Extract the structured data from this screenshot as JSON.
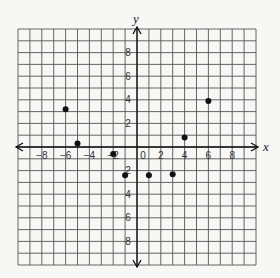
{
  "chart_data": {
    "type": "scatter",
    "title": "",
    "xlabel": "x",
    "ylabel": "y",
    "xlim": [
      -10,
      10
    ],
    "ylim": [
      -10,
      10
    ],
    "grid": true,
    "grid_step": 1,
    "x_ticks": [
      -8,
      -6,
      -4,
      -2,
      0,
      2,
      4,
      6,
      8
    ],
    "y_ticks": [
      8,
      6,
      4,
      2,
      -2,
      -4,
      -6,
      -8
    ],
    "x_tick_labels": [
      "−8",
      "−6",
      "−4",
      "−2",
      "0",
      "2",
      "4",
      "6",
      "8"
    ],
    "y_tick_labels": [
      "8",
      "6",
      "4",
      "2",
      "2",
      "4",
      "6",
      "8"
    ],
    "series": [
      {
        "name": "points",
        "points": [
          {
            "x": -6,
            "y": 3.2
          },
          {
            "x": -5,
            "y": 0.3
          },
          {
            "x": -2,
            "y": -0.6
          },
          {
            "x": -1,
            "y": -2.4
          },
          {
            "x": 1,
            "y": -2.4
          },
          {
            "x": 3,
            "y": -2.3
          },
          {
            "x": 4,
            "y": 0.8
          },
          {
            "x": 6,
            "y": 3.9
          }
        ]
      }
    ]
  },
  "colors": {
    "background": "#f7f7f5",
    "grid": "#555555",
    "axis": "#111111",
    "point": "#111111"
  }
}
